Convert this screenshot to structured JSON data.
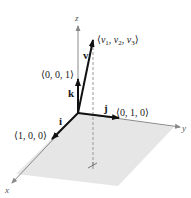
{
  "diagram": {
    "type": "3d-vector-standard-basis",
    "colors": {
      "plane_fill": "#e6e6e6",
      "axis": "#888888",
      "vector": "#111111",
      "dashed": "#999999"
    },
    "axes": {
      "x_label": "x",
      "y_label": "y",
      "z_label": "z"
    },
    "unit_vectors": [
      {
        "name": "i",
        "label": "i",
        "coords": "⟨1, 0, 0⟩"
      },
      {
        "name": "j",
        "label": "j",
        "coords": "⟨0, 1, 0⟩"
      },
      {
        "name": "k",
        "label": "k",
        "coords": "⟨0, 0, 1⟩"
      }
    ],
    "vector_v": {
      "label": "v",
      "components": [
        "v",
        "1",
        "v",
        "2",
        "v",
        "3"
      ],
      "open": "⟨",
      "close": "⟩",
      "sep": ", "
    }
  }
}
